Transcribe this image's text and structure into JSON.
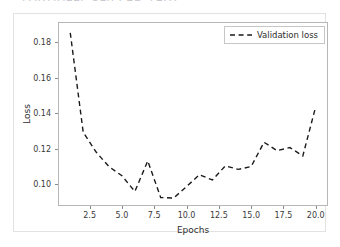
{
  "clipped_header_text": "PARTIALLY CLIPPED TEXT",
  "chart_data": {
    "type": "line",
    "title": "",
    "xlabel": "Epochs",
    "ylabel": "Loss",
    "xlim": [
      0.05,
      20.95
    ],
    "ylim": [
      0.0875,
      0.1915
    ],
    "grid": false,
    "legend_position": "upper right",
    "xticks": [
      2.5,
      5.0,
      7.5,
      10.0,
      12.5,
      15.0,
      17.5,
      20.0
    ],
    "xticklabels": [
      "2.5",
      "5.0",
      "7.5",
      "10.0",
      "12.5",
      "15.0",
      "17.5",
      "20.0"
    ],
    "yticks": [
      0.1,
      0.12,
      0.14,
      0.16,
      0.18
    ],
    "yticklabels": [
      "0.10",
      "0.12",
      "0.14",
      "0.16",
      "0.18"
    ],
    "series": [
      {
        "name": "Validation loss",
        "color": "#1a1a1a",
        "linestyle": "dashed",
        "x": [
          1,
          2,
          3,
          4,
          5,
          6,
          7,
          8,
          9,
          10,
          11,
          12,
          13,
          14,
          15,
          16,
          17,
          18,
          19,
          20
        ],
        "values": [
          0.1854,
          0.1292,
          0.118,
          0.1097,
          0.1046,
          0.0957,
          0.113,
          0.0923,
          0.092,
          0.0985,
          0.1052,
          0.1022,
          0.1102,
          0.1082,
          0.1098,
          0.1235,
          0.1188,
          0.1205,
          0.1158,
          0.1437
        ]
      }
    ],
    "legend": [
      {
        "label": "Validation loss",
        "color": "#1a1a1a",
        "linestyle": "dashed"
      }
    ]
  }
}
